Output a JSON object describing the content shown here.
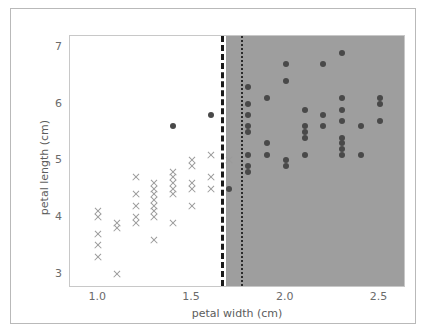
{
  "figure": {
    "background_color": "#ffffff",
    "frame_color": "#b9b9b9",
    "axes_background": "#ffffff"
  },
  "chart_data": {
    "type": "scatter",
    "title": "",
    "xlabel": "petal width (cm)",
    "ylabel": "petal length (cm)",
    "xlim": [
      0.85,
      2.63
    ],
    "ylim": [
      2.78,
      7.2
    ],
    "xticks": [
      "1.0",
      "1.5",
      "2.0",
      "2.5"
    ],
    "xtick_values": [
      1.0,
      1.5,
      2.0,
      2.5
    ],
    "yticks": [
      "3",
      "4",
      "5",
      "6",
      "7"
    ],
    "ytick_values": [
      3,
      4,
      5,
      6,
      7
    ],
    "grid": false,
    "legend": null,
    "legend_position": "none",
    "shaded_region": {
      "label": "decision region (right of boundary)",
      "color": "#9e9e9e",
      "x_start": 1.68,
      "x_end": 2.63
    },
    "boundary_lines": [
      {
        "name": "dashed-decision-boundary",
        "style": "dashed",
        "x": 1.655,
        "color": "#191919",
        "width_px": 3
      },
      {
        "name": "dotted-decision-boundary",
        "style": "dotted",
        "x": 1.76,
        "color": "#2b2b2b",
        "width_px": 2
      }
    ],
    "series": [
      {
        "name": "class-x-markers",
        "marker": "x",
        "color": "#9a9a9a",
        "points": [
          [
            1.0,
            4.1
          ],
          [
            1.0,
            4.0
          ],
          [
            1.0,
            3.7
          ],
          [
            1.0,
            3.5
          ],
          [
            1.0,
            3.3
          ],
          [
            1.1,
            3.9
          ],
          [
            1.1,
            3.8
          ],
          [
            1.1,
            3.0
          ],
          [
            1.2,
            4.7
          ],
          [
            1.2,
            4.4
          ],
          [
            1.2,
            4.2
          ],
          [
            1.2,
            4.0
          ],
          [
            1.2,
            3.9
          ],
          [
            1.3,
            4.6
          ],
          [
            1.3,
            4.5
          ],
          [
            1.3,
            4.4
          ],
          [
            1.3,
            4.3
          ],
          [
            1.3,
            4.2
          ],
          [
            1.3,
            4.1
          ],
          [
            1.3,
            4.0
          ],
          [
            1.3,
            3.6
          ],
          [
            1.4,
            4.8
          ],
          [
            1.4,
            4.7
          ],
          [
            1.4,
            4.6
          ],
          [
            1.4,
            4.5
          ],
          [
            1.4,
            4.4
          ],
          [
            1.4,
            3.9
          ],
          [
            1.5,
            5.0
          ],
          [
            1.5,
            4.9
          ],
          [
            1.5,
            4.6
          ],
          [
            1.5,
            4.5
          ],
          [
            1.5,
            4.2
          ],
          [
            1.6,
            5.1
          ],
          [
            1.6,
            4.7
          ],
          [
            1.6,
            4.5
          ],
          [
            1.7,
            5.0
          ]
        ]
      },
      {
        "name": "class-circle-markers",
        "marker": "o",
        "color": "#494949",
        "points": [
          [
            1.4,
            5.6
          ],
          [
            1.6,
            5.8
          ],
          [
            1.7,
            4.5
          ],
          [
            1.8,
            6.3
          ],
          [
            1.8,
            6.0
          ],
          [
            1.8,
            5.8
          ],
          [
            1.8,
            5.6
          ],
          [
            1.8,
            5.5
          ],
          [
            1.8,
            5.1
          ],
          [
            1.8,
            4.9
          ],
          [
            1.8,
            4.8
          ],
          [
            1.9,
            6.1
          ],
          [
            1.9,
            5.3
          ],
          [
            1.9,
            5.1
          ],
          [
            2.0,
            6.7
          ],
          [
            2.0,
            6.4
          ],
          [
            2.0,
            5.0
          ],
          [
            2.0,
            4.9
          ],
          [
            2.1,
            5.9
          ],
          [
            2.1,
            5.6
          ],
          [
            2.1,
            5.5
          ],
          [
            2.1,
            5.4
          ],
          [
            2.1,
            5.1
          ],
          [
            2.2,
            6.7
          ],
          [
            2.2,
            5.8
          ],
          [
            2.2,
            5.6
          ],
          [
            2.3,
            6.9
          ],
          [
            2.3,
            6.1
          ],
          [
            2.3,
            5.9
          ],
          [
            2.3,
            5.7
          ],
          [
            2.3,
            5.4
          ],
          [
            2.3,
            5.3
          ],
          [
            2.3,
            5.2
          ],
          [
            2.3,
            5.1
          ],
          [
            2.4,
            5.6
          ],
          [
            2.4,
            5.1
          ],
          [
            2.5,
            6.1
          ],
          [
            2.5,
            6.0
          ],
          [
            2.5,
            5.7
          ]
        ]
      }
    ]
  }
}
